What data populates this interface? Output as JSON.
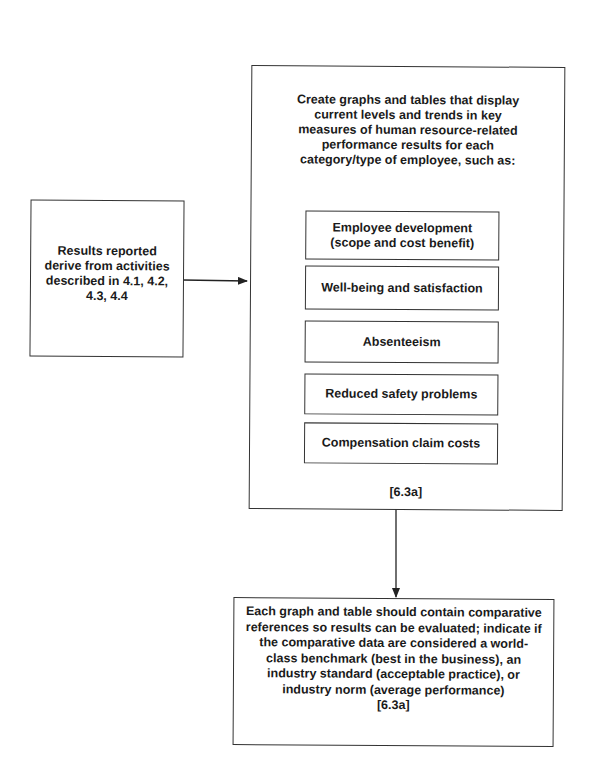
{
  "diagram": {
    "source_box": {
      "lines": [
        "Results reported",
        "derive from activities",
        "described in 4.1, 4.2,",
        "4.3, 4.4"
      ]
    },
    "main_box": {
      "title_lines": [
        "Create graphs and tables that display",
        "current levels and trends in key",
        "measures of human resource-related",
        "performance results for each",
        "category/type of employee, such as:"
      ],
      "items": [
        {
          "lines": [
            "Employee development",
            "(scope and cost benefit)"
          ]
        },
        {
          "lines": [
            "Well-being and satisfaction"
          ]
        },
        {
          "lines": [
            "Absenteeism"
          ]
        },
        {
          "lines": [
            "Reduced safety problems"
          ]
        },
        {
          "lines": [
            "Compensation claim costs"
          ]
        }
      ],
      "reference": "[6.3a]"
    },
    "result_box": {
      "lines": [
        "Each graph and table should contain comparative",
        "references so results can be evaluated; indicate if",
        "the comparative data are considered a world-",
        "class benchmark (best in the business), an",
        "industry standard (acceptable practice), or",
        "industry norm (average performance)",
        "[6.3a]"
      ]
    },
    "colors": {
      "line": "#333333",
      "text": "#1a1a1a",
      "background": "#ffffff"
    }
  }
}
